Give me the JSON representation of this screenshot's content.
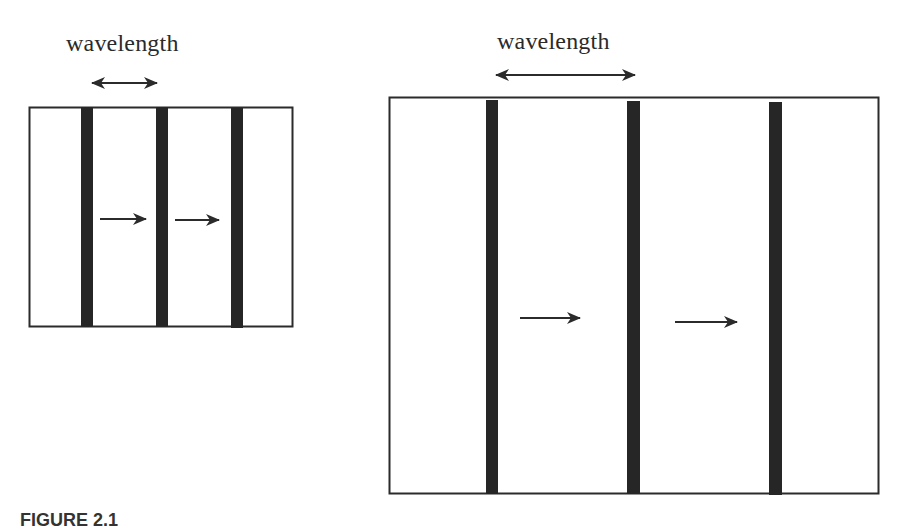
{
  "figure": {
    "panels": [
      {
        "id": "short-wavelength",
        "label": "wavelength",
        "box": {
          "x": 29,
          "y": 107,
          "w": 263,
          "h": 219
        },
        "wavefronts_x": [
          87,
          162,
          237
        ],
        "propagation_arrows": [
          {
            "x1": 100,
            "x2": 146,
            "y": 219
          },
          {
            "x1": 175,
            "x2": 219,
            "y": 220
          }
        ],
        "wavelength_arrow": {
          "x1": 90,
          "x2": 158,
          "y": 83
        }
      },
      {
        "id": "long-wavelength",
        "label": "wavelength",
        "box": {
          "x": 389,
          "y": 97,
          "w": 490,
          "h": 396
        },
        "wavefronts_x": [
          492,
          634,
          776
        ],
        "propagation_arrows": [
          {
            "x1": 520,
            "x2": 580,
            "y": 318
          },
          {
            "x1": 675,
            "x2": 737,
            "y": 322
          }
        ],
        "wavelength_arrow": {
          "x1": 495,
          "x2": 635,
          "y": 75
        }
      }
    ],
    "caption_fragment": "FIGURE 2.1",
    "colors": {
      "stroke": "#2b2b2b",
      "wavefront": "#262626",
      "background": "#ffffff"
    }
  }
}
